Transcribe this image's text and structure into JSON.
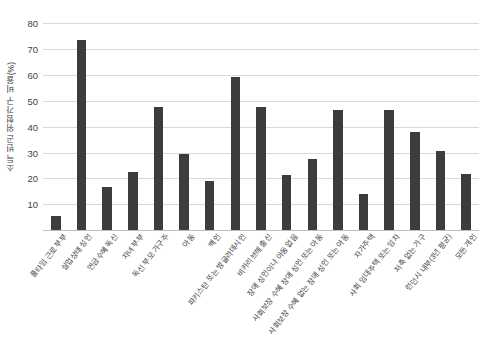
{
  "chart_data": {
    "type": "bar",
    "title": "",
    "subtitle": "",
    "xlabel": "",
    "ylabel": "소득 빈곤 위험가구 비율(%)",
    "ylim": [
      0,
      84
    ],
    "ytick_labels": [
      "10",
      "20",
      "30",
      "40",
      "50",
      "60",
      "70",
      "80"
    ],
    "ytick_values": [
      10,
      20,
      30,
      40,
      50,
      60,
      70,
      80
    ],
    "grid": true,
    "legend": null,
    "bar_color": "#3c3c3c",
    "categories": [
      "풀타임 근로 부부",
      "실업상태 성인",
      "연금수혜 독신",
      "자녀 부부",
      "독신 부모 가구주",
      "아동",
      "백인",
      "파키스탄 또는 방글라데시인",
      "비카리브해 출신",
      "장애 성인이나 아동 없음",
      "사회보장 수혜 장애 성인 또는 아동",
      "사회보장 수혜 없는 장애 성인 또는 아동",
      "자가주택",
      "사회 임대주택 또는 임차",
      "저축 없는 가구",
      "런던시 내부(3년 평균)",
      "모든 개인"
    ],
    "values": [
      6,
      74,
      17,
      23,
      48,
      30,
      19.5,
      59.5,
      48,
      21.5,
      28,
      47,
      14.5,
      47,
      38.5,
      31,
      22
    ]
  }
}
